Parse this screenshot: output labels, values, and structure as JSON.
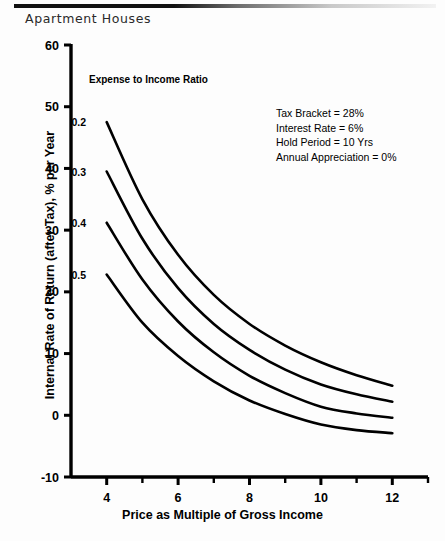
{
  "document": {
    "title": "Apartment Houses",
    "rule_color": "#111111"
  },
  "chart_data": {
    "type": "line",
    "title": "Apartment Houses",
    "xlabel": "Price as Multiple of Gross Income",
    "ylabel": "Internal Rate of Return (after Tax), % per Year",
    "xlim": [
      3,
      13
    ],
    "ylim": [
      -10,
      60
    ],
    "xticks": [
      4,
      6,
      8,
      10,
      12
    ],
    "xtick_labels": [
      "4",
      "6",
      "8",
      "10",
      "12"
    ],
    "xminor_ticks": [
      5,
      7,
      9,
      11,
      13
    ],
    "yticks": [
      -10,
      0,
      10,
      20,
      30,
      40,
      50,
      60
    ],
    "ytick_labels": [
      "-10",
      "0",
      "10",
      "20",
      "30",
      "40",
      "50",
      "60"
    ],
    "grid": false,
    "legend_position": "inline-left",
    "legend_title": "Expense to Income Ratio",
    "x": [
      4,
      5,
      6,
      7,
      8,
      9,
      10,
      11,
      12
    ],
    "series": [
      {
        "name": "0.2",
        "label": "0.2",
        "values": [
          47.5,
          35.0,
          26.0,
          19.5,
          14.8,
          11.3,
          8.6,
          6.5,
          4.8
        ]
      },
      {
        "name": "0.3",
        "label": "0.3",
        "values": [
          39.5,
          28.6,
          20.6,
          14.8,
          10.6,
          7.4,
          5.0,
          3.4,
          2.2
        ]
      },
      {
        "name": "0.4",
        "label": "0.4",
        "values": [
          31.2,
          22.0,
          15.2,
          10.2,
          6.4,
          3.6,
          1.4,
          0.3,
          -0.4
        ]
      },
      {
        "name": "0.5",
        "label": "0.5",
        "values": [
          22.8,
          15.0,
          9.6,
          5.5,
          2.4,
          0.2,
          -1.5,
          -2.4,
          -2.9
        ]
      }
    ],
    "annotations": [
      "Tax Bracket = 28%",
      "Interest Rate = 6%",
      "Hold Period = 10 Yrs",
      "Annual Appreciation = 0%"
    ],
    "line_color": "#000000"
  }
}
